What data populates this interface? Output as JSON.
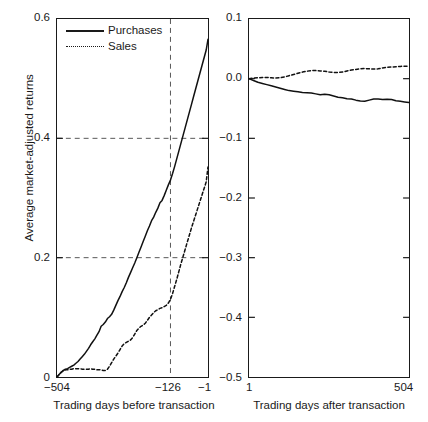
{
  "chart_data": {
    "type": "line",
    "title": "",
    "ylabel": "Average market-adjusted returns",
    "panels": [
      {
        "id": "before",
        "xlabel": "Trading days before transaction",
        "xticks": [
          "−504",
          "−126",
          "−1"
        ],
        "xtick_values": [
          -504,
          -126,
          -1
        ],
        "xlim": [
          -504,
          -1
        ],
        "ylim": [
          0.0,
          0.6
        ],
        "yticks": [
          "0",
          "0.2",
          "0.4",
          "0.6"
        ],
        "ytick_values": [
          0,
          0.2,
          0.4,
          0.6
        ],
        "grid": "dashed-at-0.2-0.4-and-x=-126",
        "series": [
          {
            "name": "Purchases",
            "style": "solid",
            "x": [
              -504,
              -497,
              -490,
              -483,
              -476,
              -469,
              -462,
              -455,
              -448,
              -441,
              -434,
              -427,
              -420,
              -413,
              -406,
              -399,
              -392,
              -385,
              -378,
              -371,
              -364,
              -357,
              -350,
              -343,
              -336,
              -329,
              -322,
              -315,
              -308,
              -301,
              -294,
              -287,
              -280,
              -273,
              -266,
              -259,
              -252,
              -245,
              -238,
              -231,
              -224,
              -217,
              -210,
              -203,
              -196,
              -189,
              -182,
              -175,
              -168,
              -161,
              -154,
              -147,
              -140,
              -133,
              -126,
              -119,
              -112,
              -105,
              -98,
              -91,
              -84,
              -77,
              -70,
              -63,
              -56,
              -49,
              -42,
              -35,
              -28,
              -21,
              -14,
              -7,
              -1
            ],
            "y": [
              0.0,
              0.004,
              0.008,
              0.011,
              0.013,
              0.014,
              0.016,
              0.018,
              0.02,
              0.023,
              0.026,
              0.03,
              0.034,
              0.038,
              0.043,
              0.048,
              0.054,
              0.059,
              0.064,
              0.07,
              0.076,
              0.085,
              0.088,
              0.092,
              0.098,
              0.101,
              0.105,
              0.112,
              0.12,
              0.128,
              0.135,
              0.143,
              0.15,
              0.158,
              0.167,
              0.175,
              0.183,
              0.191,
              0.2,
              0.209,
              0.218,
              0.227,
              0.236,
              0.245,
              0.253,
              0.262,
              0.268,
              0.276,
              0.283,
              0.292,
              0.296,
              0.304,
              0.313,
              0.322,
              0.33,
              0.341,
              0.353,
              0.366,
              0.379,
              0.392,
              0.405,
              0.418,
              0.431,
              0.444,
              0.457,
              0.47,
              0.483,
              0.496,
              0.509,
              0.522,
              0.535,
              0.548,
              0.566
            ]
          },
          {
            "name": "Sales",
            "style": "dotted",
            "x": [
              -504,
              -497,
              -490,
              -483,
              -476,
              -469,
              -462,
              -455,
              -448,
              -441,
              -434,
              -427,
              -420,
              -413,
              -406,
              -399,
              -392,
              -385,
              -378,
              -371,
              -364,
              -357,
              -350,
              -343,
              -336,
              -329,
              -322,
              -315,
              -308,
              -301,
              -294,
              -287,
              -280,
              -273,
              -266,
              -259,
              -252,
              -245,
              -238,
              -231,
              -224,
              -217,
              -210,
              -203,
              -196,
              -189,
              -182,
              -175,
              -168,
              -161,
              -154,
              -147,
              -140,
              -133,
              -126,
              -119,
              -112,
              -105,
              -98,
              -91,
              -84,
              -77,
              -70,
              -63,
              -56,
              -49,
              -42,
              -35,
              -28,
              -21,
              -14,
              -7,
              -1
            ],
            "y": [
              0.0,
              0.004,
              0.008,
              0.01,
              0.012,
              0.012,
              0.013,
              0.013,
              0.014,
              0.014,
              0.014,
              0.014,
              0.013,
              0.013,
              0.013,
              0.013,
              0.014,
              0.013,
              0.013,
              0.012,
              0.012,
              0.012,
              0.011,
              0.011,
              0.013,
              0.018,
              0.024,
              0.03,
              0.035,
              0.04,
              0.046,
              0.052,
              0.056,
              0.058,
              0.06,
              0.062,
              0.066,
              0.072,
              0.078,
              0.082,
              0.085,
              0.087,
              0.09,
              0.095,
              0.1,
              0.104,
              0.108,
              0.111,
              0.113,
              0.115,
              0.116,
              0.118,
              0.12,
              0.124,
              0.13,
              0.14,
              0.152,
              0.164,
              0.177,
              0.19,
              0.202,
              0.214,
              0.226,
              0.238,
              0.25,
              0.261,
              0.272,
              0.283,
              0.294,
              0.305,
              0.316,
              0.327,
              0.352
            ]
          }
        ]
      },
      {
        "id": "after",
        "xlabel": "Trading days after transaction",
        "xticks": [
          "1",
          "504"
        ],
        "xtick_values": [
          1,
          504
        ],
        "xlim": [
          1,
          504
        ],
        "ylim": [
          -0.5,
          0.1
        ],
        "yticks": [
          "−0.5",
          "−0.4",
          "−0.3",
          "−0.2",
          "−0.1",
          "0.0",
          "0.1"
        ],
        "ytick_values": [
          -0.5,
          -0.4,
          -0.3,
          -0.2,
          -0.1,
          0.0,
          0.1
        ],
        "grid": "none",
        "series": [
          {
            "name": "Purchases",
            "style": "solid",
            "x": [
              1,
              15,
              29,
              43,
              57,
              71,
              85,
              99,
              113,
              127,
              141,
              155,
              169,
              183,
              197,
              211,
              225,
              239,
              253,
              267,
              281,
              295,
              309,
              323,
              337,
              351,
              365,
              379,
              393,
              407,
              421,
              435,
              449,
              463,
              477,
              490,
              504
            ],
            "y": [
              0.0,
              -0.003,
              -0.006,
              -0.008,
              -0.01,
              -0.012,
              -0.014,
              -0.016,
              -0.018,
              -0.02,
              -0.021,
              -0.022,
              -0.023,
              -0.0235,
              -0.024,
              -0.0255,
              -0.027,
              -0.026,
              -0.027,
              -0.029,
              -0.031,
              -0.032,
              -0.0335,
              -0.034,
              -0.036,
              -0.0375,
              -0.038,
              -0.036,
              -0.034,
              -0.034,
              -0.035,
              -0.0345,
              -0.035,
              -0.037,
              -0.038,
              -0.039,
              -0.04
            ]
          },
          {
            "name": "Sales",
            "style": "dotted",
            "x": [
              1,
              15,
              29,
              43,
              57,
              71,
              85,
              99,
              113,
              127,
              141,
              155,
              169,
              183,
              197,
              211,
              225,
              239,
              253,
              267,
              281,
              295,
              309,
              323,
              337,
              351,
              365,
              379,
              393,
              407,
              421,
              435,
              449,
              463,
              477,
              490,
              504
            ],
            "y": [
              0.0,
              0.001,
              0.0015,
              0.002,
              0.002,
              0.0015,
              0.001,
              0.0015,
              0.003,
              0.005,
              0.007,
              0.009,
              0.011,
              0.0125,
              0.0135,
              0.0135,
              0.013,
              0.0125,
              0.011,
              0.0105,
              0.0105,
              0.011,
              0.013,
              0.0145,
              0.0155,
              0.0165,
              0.017,
              0.0165,
              0.016,
              0.0165,
              0.018,
              0.019,
              0.0195,
              0.02,
              0.0205,
              0.021,
              0.021
            ]
          }
        ]
      }
    ],
    "legend": {
      "position": "top-left-of-left-panel",
      "entries": [
        {
          "label": "Purchases",
          "style": "solid"
        },
        {
          "label": "Sales",
          "style": "dotted"
        }
      ]
    }
  }
}
